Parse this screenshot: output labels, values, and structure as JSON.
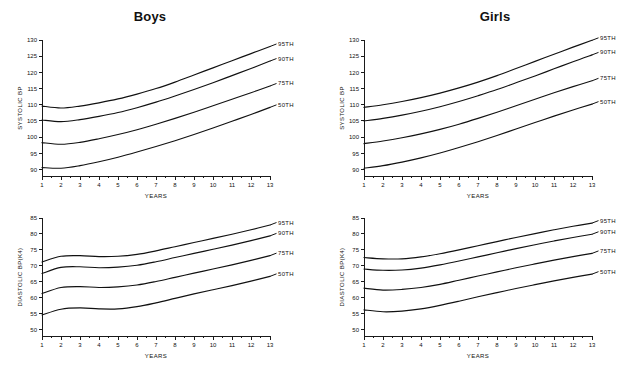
{
  "figure": {
    "background_color": "#ffffff",
    "ink_color": "#111111"
  },
  "panels": {
    "boys": {
      "title": "Boys"
    },
    "girls": {
      "title": "Girls"
    }
  },
  "axes": {
    "x_title": "YEARS",
    "systolic_y_title": "SYSTOLIC BP",
    "diastolic_y_title": "DIASTOLIC BP(K4)",
    "x_ticks": [
      "1",
      "2",
      "3",
      "4",
      "5",
      "6",
      "7",
      "8",
      "9",
      "10",
      "11",
      "12",
      "13"
    ],
    "systolic_y_ticks": [
      "90",
      "95",
      "100",
      "105",
      "110",
      "115",
      "120",
      "125",
      "130"
    ],
    "diastolic_y_ticks": [
      "50",
      "55",
      "60",
      "65",
      "70",
      "75",
      "80",
      "85"
    ]
  },
  "series_labels": [
    "95TH",
    "90TH",
    "75TH",
    "50TH"
  ],
  "chart_data": [
    {
      "id": "boys-systolic",
      "type": "line",
      "title": "Boys",
      "xlabel": "YEARS",
      "ylabel": "SYSTOLIC BP",
      "xlim": [
        1,
        13
      ],
      "ylim": [
        88,
        130
      ],
      "grid": false,
      "legend": "right-inline",
      "x": [
        1,
        2,
        3,
        4,
        5,
        6,
        7,
        8,
        9,
        10,
        11,
        12,
        13
      ],
      "series": [
        {
          "name": "95TH",
          "values": [
            109.6,
            109.0,
            109.6,
            110.6,
            111.8,
            113.3,
            115.0,
            117.0,
            119.2,
            121.4,
            123.6,
            125.8,
            128.0
          ]
        },
        {
          "name": "90TH",
          "values": [
            105.3,
            104.8,
            105.4,
            106.4,
            107.6,
            109.1,
            110.8,
            112.7,
            114.7,
            116.8,
            119.0,
            121.2,
            123.5
          ]
        },
        {
          "name": "75TH",
          "values": [
            98.3,
            97.8,
            98.4,
            99.5,
            100.8,
            102.3,
            104.0,
            105.8,
            107.7,
            109.7,
            111.7,
            113.7,
            115.8
          ]
        },
        {
          "name": "50TH",
          "values": [
            90.6,
            90.4,
            91.2,
            92.4,
            93.8,
            95.4,
            97.1,
            98.9,
            100.8,
            102.8,
            104.9,
            107.0,
            109.2
          ]
        }
      ]
    },
    {
      "id": "girls-systolic",
      "type": "line",
      "title": "Girls",
      "xlabel": "YEARS",
      "ylabel": "SYSTOLIC BP",
      "xlim": [
        1,
        13
      ],
      "ylim": [
        88,
        130
      ],
      "grid": false,
      "legend": "right-inline",
      "x": [
        1,
        2,
        3,
        4,
        5,
        6,
        7,
        8,
        9,
        10,
        11,
        12,
        13
      ],
      "series": [
        {
          "name": "95TH",
          "values": [
            109.2,
            110.0,
            111.0,
            112.2,
            113.6,
            115.2,
            117.0,
            119.0,
            121.2,
            123.4,
            125.6,
            127.8,
            129.9
          ]
        },
        {
          "name": "90TH",
          "values": [
            105.0,
            105.8,
            106.8,
            108.0,
            109.4,
            111.0,
            112.8,
            114.7,
            116.8,
            118.9,
            121.1,
            123.3,
            125.4
          ]
        },
        {
          "name": "75TH",
          "values": [
            98.0,
            98.8,
            99.8,
            101.0,
            102.4,
            104.0,
            105.8,
            107.7,
            109.7,
            111.7,
            113.7,
            115.6,
            117.4
          ]
        },
        {
          "name": "50TH",
          "values": [
            90.4,
            91.2,
            92.3,
            93.6,
            95.1,
            96.8,
            98.6,
            100.5,
            102.5,
            104.5,
            106.5,
            108.4,
            110.2
          ]
        }
      ]
    },
    {
      "id": "boys-diastolic",
      "type": "line",
      "title": "Boys",
      "xlabel": "YEARS",
      "ylabel": "DIASTOLIC BP(K4)",
      "xlim": [
        1,
        13
      ],
      "ylim": [
        48,
        85
      ],
      "grid": false,
      "legend": "right-inline",
      "x": [
        1,
        2,
        3,
        4,
        5,
        6,
        7,
        8,
        9,
        10,
        11,
        12,
        13
      ],
      "series": [
        {
          "name": "95TH",
          "values": [
            71.2,
            73.0,
            73.2,
            72.9,
            73.0,
            73.6,
            74.7,
            76.0,
            77.3,
            78.6,
            79.9,
            81.3,
            82.8
          ]
        },
        {
          "name": "90TH",
          "values": [
            67.6,
            69.5,
            69.7,
            69.4,
            69.6,
            70.2,
            71.3,
            72.6,
            73.9,
            75.2,
            76.5,
            77.9,
            79.4
          ]
        },
        {
          "name": "75TH",
          "values": [
            61.3,
            63.2,
            63.5,
            63.2,
            63.4,
            64.0,
            65.1,
            66.4,
            67.7,
            69.0,
            70.3,
            71.7,
            73.2
          ]
        },
        {
          "name": "50TH",
          "values": [
            54.6,
            56.4,
            56.8,
            56.5,
            56.5,
            57.2,
            58.4,
            59.8,
            61.2,
            62.5,
            63.8,
            65.2,
            66.7
          ]
        }
      ]
    },
    {
      "id": "girls-diastolic",
      "type": "line",
      "title": "Girls",
      "xlabel": "YEARS",
      "ylabel": "DIASTOLIC BP(K4)",
      "xlim": [
        1,
        13
      ],
      "ylim": [
        48,
        85
      ],
      "grid": false,
      "legend": "right-inline",
      "x": [
        1,
        2,
        3,
        4,
        5,
        6,
        7,
        8,
        9,
        10,
        11,
        12,
        13
      ],
      "series": [
        {
          "name": "95TH",
          "values": [
            72.6,
            72.2,
            72.2,
            72.8,
            73.8,
            75.0,
            76.3,
            77.6,
            78.9,
            80.1,
            81.3,
            82.4,
            83.4
          ]
        },
        {
          "name": "90TH",
          "values": [
            69.0,
            68.6,
            68.7,
            69.3,
            70.3,
            71.5,
            72.8,
            74.1,
            75.4,
            76.6,
            77.8,
            78.9,
            79.9
          ]
        },
        {
          "name": "75TH",
          "values": [
            63.0,
            62.4,
            62.6,
            63.2,
            64.2,
            65.5,
            66.8,
            68.1,
            69.4,
            70.6,
            71.8,
            72.9,
            73.9
          ]
        },
        {
          "name": "50TH",
          "values": [
            56.2,
            55.6,
            55.8,
            56.5,
            57.6,
            58.9,
            60.3,
            61.6,
            62.9,
            64.1,
            65.3,
            66.4,
            67.4
          ]
        }
      ]
    }
  ]
}
